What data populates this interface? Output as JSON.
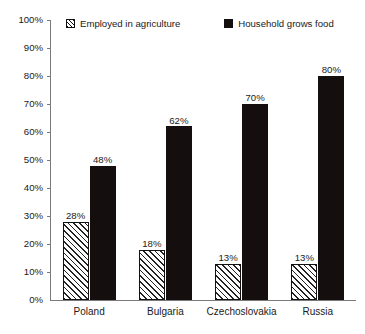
{
  "chart_data": {
    "type": "bar",
    "title": "",
    "xlabel": "",
    "ylabel": "",
    "ylim": [
      0,
      100
    ],
    "ytick_labels": [
      "100%",
      "90%",
      "80%",
      "70%",
      "60%",
      "50%",
      "40%",
      "30%",
      "20%",
      "10%",
      "0%"
    ],
    "ytick_values": [
      100,
      90,
      80,
      70,
      60,
      50,
      40,
      30,
      20,
      10,
      0
    ],
    "grid": false,
    "legend_position": "top",
    "categories": [
      "Poland",
      "Bulgaria",
      "Czechoslovakia",
      "Russia"
    ],
    "series": [
      {
        "name": "Employed in agriculture",
        "style": "hatched",
        "color": "#ffffff",
        "values": [
          28,
          18,
          13,
          13
        ],
        "labels": [
          "28%",
          "18%",
          "13%",
          "13%"
        ]
      },
      {
        "name": "Household grows food",
        "style": "solid",
        "color": "#140e0e",
        "values": [
          48,
          62,
          70,
          80
        ],
        "labels": [
          "48%",
          "62%",
          "70%",
          "80%"
        ]
      }
    ]
  },
  "legend": {
    "items": [
      {
        "label": "Employed in agriculture",
        "swatch": "hatched-square-icon"
      },
      {
        "label": "Household grows food",
        "swatch": "filled-square-icon"
      }
    ]
  }
}
